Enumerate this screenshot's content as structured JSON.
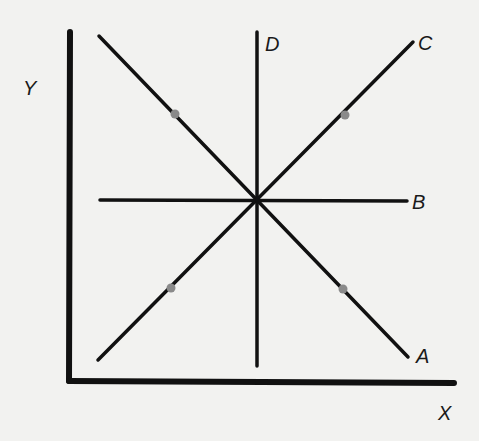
{
  "diagram": {
    "axes": {
      "x_label": "X",
      "y_label": "Y"
    },
    "lines": [
      {
        "label": "A",
        "description": "downward-sloping line through center"
      },
      {
        "label": "B",
        "description": "horizontal line through center"
      },
      {
        "label": "C",
        "description": "upward-sloping line through center"
      },
      {
        "label": "D",
        "description": "vertical line through center"
      }
    ],
    "points_count": 4,
    "colors": {
      "background": "#f2f2f0",
      "ink": "#111111",
      "points": "#8a8a8a"
    }
  }
}
